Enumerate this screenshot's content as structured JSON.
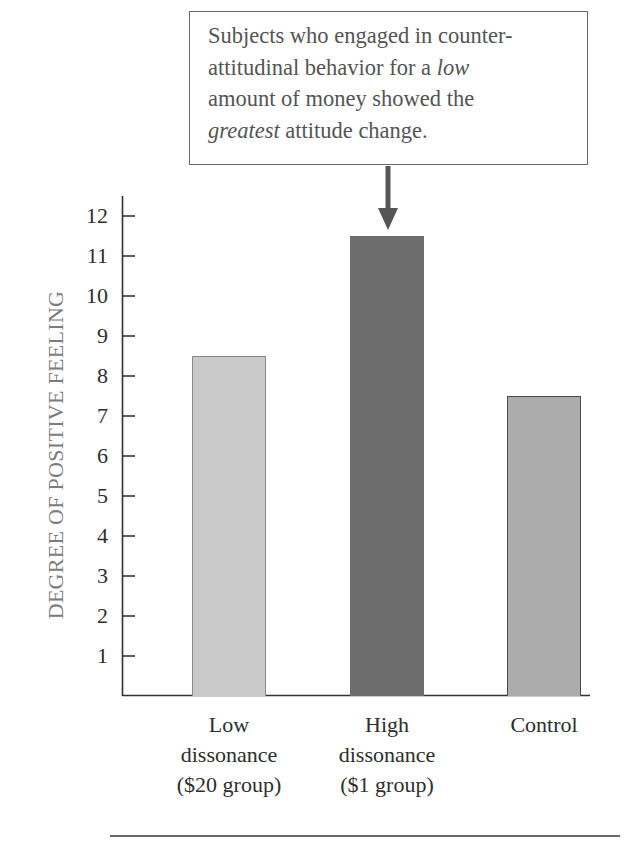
{
  "callout": {
    "lines": [
      {
        "parts": [
          {
            "text": "Subjects who engaged in counter-",
            "italic": false
          }
        ]
      },
      {
        "parts": [
          {
            "text": "attitudinal behavior for a ",
            "italic": false
          },
          {
            "text": "low",
            "italic": true
          }
        ]
      },
      {
        "parts": [
          {
            "text": "amount of money showed the",
            "italic": false
          }
        ]
      },
      {
        "parts": [
          {
            "text": "greatest",
            "italic": true
          },
          {
            "text": " attitude change.",
            "italic": false
          }
        ]
      }
    ]
  },
  "axis": {
    "ylabel": "DEGREE OF POSITIVE FEELING",
    "ticks": [
      "1",
      "2",
      "3",
      "4",
      "5",
      "6",
      "7",
      "8",
      "9",
      "10",
      "11",
      "12"
    ]
  },
  "bars": [
    {
      "label_lines": [
        "Low",
        "dissonance",
        "($20 group)"
      ],
      "value": 8.5,
      "fill": "#c9c9c9",
      "border": "#8a8a8a"
    },
    {
      "label_lines": [
        "High",
        "dissonance",
        "($1 group)"
      ],
      "value": 11.5,
      "fill": "#6d6d6d",
      "border": "#6d6d6d"
    },
    {
      "label_lines": [
        "Control"
      ],
      "value": 7.5,
      "fill": "#acacac",
      "border": "#4a4a4a"
    }
  ],
  "chart_data": {
    "type": "bar",
    "title": "",
    "categories": [
      "Low dissonance ($20 group)",
      "High dissonance ($1 group)",
      "Control"
    ],
    "values": [
      8.5,
      11.5,
      7.5
    ],
    "xlabel": "",
    "ylabel": "DEGREE OF POSITIVE FEELING",
    "ylim": [
      0,
      12.5
    ],
    "yticks": [
      1,
      2,
      3,
      4,
      5,
      6,
      7,
      8,
      9,
      10,
      11,
      12
    ],
    "grid": false,
    "legend": null,
    "annotations": [
      {
        "text": "Subjects who engaged in counter-attitudinal behavior for a low amount of money showed the greatest attitude change.",
        "points_to": "High dissonance ($1 group)"
      }
    ]
  }
}
